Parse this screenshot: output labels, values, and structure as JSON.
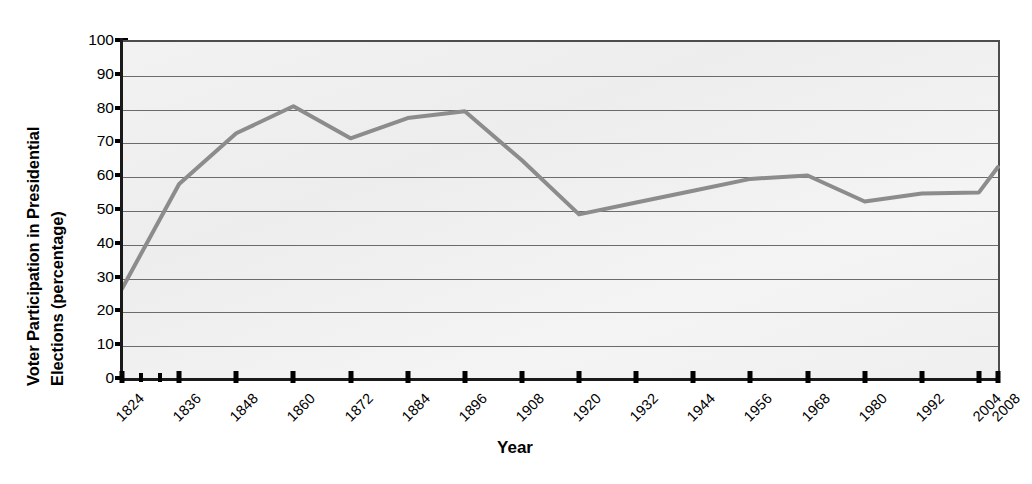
{
  "chart_data": {
    "type": "line",
    "title": "",
    "subtitle": "",
    "xlabel": "Year",
    "ylabel": "Voter Participation in Presidential Elections (percentage)",
    "ylabel_line1": "Voter Participation in Presidential",
    "ylabel_line2": "Elections (percentage)",
    "ylim": [
      0,
      100
    ],
    "ytick_step": 10,
    "yticks": [
      0,
      10,
      20,
      30,
      40,
      50,
      60,
      70,
      80,
      90,
      100
    ],
    "ytick_labels": [
      "0",
      "10",
      "20",
      "30",
      "40",
      "50",
      "60",
      "70",
      "80",
      "90",
      "100"
    ],
    "grid": true,
    "grid_axis": "y",
    "legend": false,
    "legend_position": "none",
    "categories": [
      1824,
      1836,
      1848,
      1860,
      1872,
      1884,
      1896,
      1908,
      1920,
      1932,
      1944,
      1956,
      1968,
      1980,
      1992,
      2004,
      2008
    ],
    "xtick_labels": [
      "1824",
      "1836",
      "1848",
      "1860",
      "1872",
      "1884",
      "1896",
      "1908",
      "1920",
      "1932",
      "1944",
      "1956",
      "1968",
      "1980",
      "1992",
      "2004",
      "2008"
    ],
    "xtick_label_rotation": -45,
    "series": [
      {
        "name": "Voter participation",
        "color": "#8c8c8c",
        "line_width": 4,
        "markers": false,
        "values": [
          27,
          58,
          73,
          81,
          71.5,
          77.5,
          79.5,
          65,
          49,
          52.5,
          56,
          59.5,
          60.5,
          52.8,
          55.2,
          55.5,
          63
        ]
      }
    ],
    "annotations": [],
    "colors": {
      "line": "#8c8c8c",
      "gridline": "#6b6b6b",
      "axis": "#1a1a1a",
      "plot_background": "#f0f0f0",
      "page_background": "#ffffff",
      "text": "#000000"
    }
  }
}
